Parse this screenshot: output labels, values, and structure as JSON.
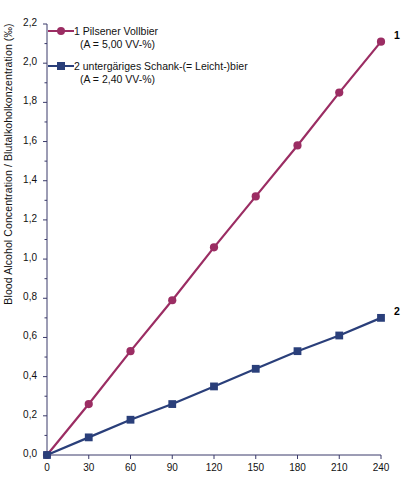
{
  "chart_data": {
    "type": "line",
    "title": "",
    "subtitle": "",
    "xlabel": "",
    "ylabel": "Blood Alcohol Concentration / Blutalkoholkonzentration (‰)",
    "x": [
      0,
      30,
      60,
      90,
      120,
      150,
      180,
      210,
      240
    ],
    "xlim": [
      0,
      240
    ],
    "ylim": [
      0.0,
      2.2
    ],
    "grid": false,
    "legend_position": "top-left",
    "x_tick_labels": [
      "0",
      "30",
      "60",
      "90",
      "120",
      "150",
      "180",
      "210",
      "240"
    ],
    "y_tick_labels": [
      "0,0",
      "0,2",
      "0,4",
      "0,6",
      "0,8",
      "1,0",
      "1,2",
      "1,4",
      "1,6",
      "1,8",
      "2,0",
      "2,2"
    ],
    "y_ticks": [
      0.0,
      0.2,
      0.4,
      0.6,
      0.8,
      1.0,
      1.2,
      1.4,
      1.6,
      1.8,
      2.0,
      2.2
    ],
    "series": [
      {
        "name": "1 Pilsener Vollbier",
        "sublabel": "(A = 5,00 VV-%)",
        "legend_text": "1 Pilsener Vollbier",
        "end_label": "1",
        "color": "#9B2D63",
        "marker": "circle",
        "values": [
          0.0,
          0.26,
          0.53,
          0.79,
          1.06,
          1.32,
          1.58,
          1.85,
          2.11
        ]
      },
      {
        "name": "2 untergäriges Schank-(= Leicht-)bier",
        "sublabel": "(A = 2,40 VV-%)",
        "legend_text": "2 untergäriges Schank-(= Leicht-)bier",
        "end_label": "2",
        "color": "#2A3F7A",
        "marker": "square",
        "values": [
          0.0,
          0.09,
          0.18,
          0.26,
          0.35,
          0.44,
          0.53,
          0.61,
          0.7
        ]
      }
    ]
  },
  "axis": {
    "line_color": "#3a3a6a"
  }
}
